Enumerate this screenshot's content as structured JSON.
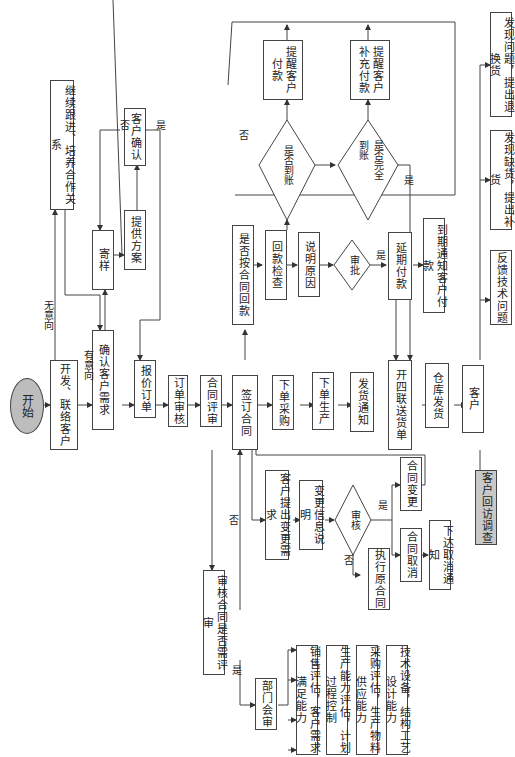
{
  "diagram": {
    "orientation": "rotated-90-clockwise",
    "nodes": {
      "start": "开始",
      "develop_contact": "开发、联络客户",
      "follow_up": "继续跟进、培养合作关系",
      "confirm_needs": "确认客户需求",
      "send_sample": "寄样",
      "provide_plan": "提供方案",
      "customer_confirm": "客户确认",
      "quote_order": "报价订单",
      "order_review": "订单审核",
      "contract_review": "合同评审",
      "sign_contract": "签订合同",
      "payment_on_time": "是否按合同回款",
      "payment_check": "回款检查",
      "arrived": "是否到账",
      "remind_pay": "提醒客户\n付款",
      "fully_arrived": "是否完全\n到账",
      "remind_supplement": "提醒客户\n补充付款",
      "explain_reason": "说明原因",
      "approve": "审批",
      "defer_pay": "延期付款",
      "notify_due": "到期通知客户付款",
      "purchase_order": "下单采购",
      "production_order": "下单生产",
      "shipping_notice": "发货通知",
      "delivery_note": "开四联送货单",
      "warehouse_ship": "仓库发货",
      "customer": "客户",
      "tech_feedback": "反馈技术问题",
      "shortage": "发现缺货，提出补货",
      "return_exchange": "发现问题，提出退换货",
      "change_request": "客户提出变更需求",
      "change_info": "变更信息说明",
      "audit": "审核",
      "exec_original": "执行原合同",
      "contract_change": "合同变更",
      "contract_cancel": "合同取消",
      "cancel_notice": "下达取消通知",
      "customer_visit": "客户回访调查",
      "need_review": "审核合同是否需评审",
      "dept_review": "部门会审",
      "sales_eval": "销售评估，客户需求满足能力",
      "prod_eval": "生产能力评估，计划过程控制",
      "purch_eval": "采购评估，生产物料供应能力",
      "tech_eval": "技术设备，结构工艺设计能力"
    },
    "edge_labels": {
      "no_intent": "无意向",
      "has_intent": "有意向",
      "no": "否",
      "yes": "是"
    }
  }
}
